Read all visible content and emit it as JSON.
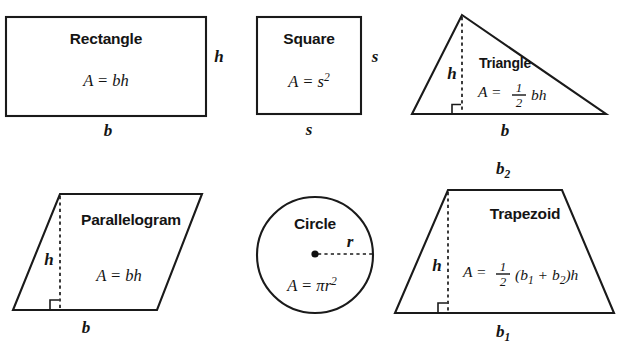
{
  "page": {
    "background_color": "#ffffff",
    "width": 627,
    "height": 343
  },
  "palette": {
    "fill_dark_gray": "#bfbfbf",
    "fill_light_gray": "#e6e6e6",
    "fill_mid_gray": "#eaeaea",
    "stroke": "#1a1a1a",
    "text": "#141414"
  },
  "figures": [
    {
      "id": "rectangle",
      "name": "Rectangle",
      "formula_text": "A = bh",
      "formula_parts": {
        "lhs": "A",
        "eq": "=",
        "rhs": "bh"
      },
      "fill": "#bfbfbf",
      "dimension_labels": [
        {
          "id": "rectangle-height-label",
          "text": "h",
          "position": "right"
        },
        {
          "id": "rectangle-base-label",
          "text": "b",
          "position": "bottom"
        }
      ],
      "has_dashed_height": false,
      "has_right_angle_mark": false
    },
    {
      "id": "square",
      "name": "Square",
      "formula_text": "A = s2",
      "formula_parts": {
        "lhs": "A",
        "eq": "=",
        "base": "s",
        "exponent": "2"
      },
      "fill": "#e6e6e6",
      "dimension_labels": [
        {
          "id": "square-side-right-label",
          "text": "s",
          "position": "right"
        },
        {
          "id": "square-side-bottom-label",
          "text": "s",
          "position": "bottom"
        }
      ],
      "has_dashed_height": false,
      "has_right_angle_mark": false
    },
    {
      "id": "triangle",
      "name": "Triangle",
      "formula_text": "A = 1/2 bh",
      "formula_parts": {
        "lhs": "A",
        "eq": "=",
        "numerator": "1",
        "denominator": "2",
        "rhs": "bh"
      },
      "fill": "#eaeaea",
      "dimension_labels": [
        {
          "id": "triangle-height-label",
          "text": "h",
          "position": "inside-left"
        },
        {
          "id": "triangle-base-label",
          "text": "b",
          "position": "bottom"
        }
      ],
      "has_dashed_height": true,
      "has_right_angle_mark": true
    },
    {
      "id": "parallelogram",
      "name": "Parallelogram",
      "formula_text": "A = bh",
      "formula_parts": {
        "lhs": "A",
        "eq": "=",
        "rhs": "bh"
      },
      "fill": "#c6c6c6",
      "dimension_labels": [
        {
          "id": "parallelogram-height-label",
          "text": "h",
          "position": "inside-left"
        },
        {
          "id": "parallelogram-base-label",
          "text": "b",
          "position": "bottom"
        }
      ],
      "has_dashed_height": true,
      "has_right_angle_mark": true
    },
    {
      "id": "circle",
      "name": "Circle",
      "formula_text": "A = πr2",
      "formula_parts": {
        "lhs": "A",
        "eq": "=",
        "pi": "π",
        "base": "r",
        "exponent": "2"
      },
      "fill": "#e6e6e6",
      "dimension_labels": [
        {
          "id": "circle-radius-label",
          "text": "r",
          "position": "radius"
        }
      ],
      "has_dashed_radius": true,
      "has_center_dot": true
    },
    {
      "id": "trapezoid",
      "name": "Trapezoid",
      "formula_text": "A = 1/2 (b1 + b2)h",
      "formula_parts": {
        "lhs": "A",
        "eq": "=",
        "numerator": "1",
        "denominator": "2",
        "open_paren": "(",
        "base1": "b",
        "base1_sub": "1",
        "plus": "+",
        "base2": "b",
        "base2_sub": "2",
        "close_paren": ")",
        "height": "h"
      },
      "fill": "#c4c4c4",
      "dimension_labels": [
        {
          "id": "trapezoid-top-base-label",
          "text": "b",
          "subscript": "2",
          "position": "top"
        },
        {
          "id": "trapezoid-height-label",
          "text": "h",
          "position": "inside-left"
        },
        {
          "id": "trapezoid-bottom-base-label",
          "text": "b",
          "subscript": "1",
          "position": "bottom"
        }
      ],
      "has_dashed_height": true,
      "has_right_angle_mark": true
    }
  ]
}
